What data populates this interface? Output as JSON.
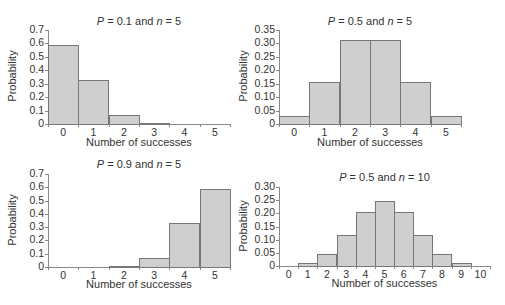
{
  "chart_data": [
    {
      "type": "bar",
      "title": "P = 0.1 and n = 5",
      "title_parts": {
        "p_label": "P",
        "p_value": " = 0.1 and ",
        "n_label": "n",
        "n_value": " = 5"
      },
      "xlabel": "Number of successes",
      "ylabel": "Probability",
      "categories": [
        "0",
        "1",
        "2",
        "3",
        "4",
        "5"
      ],
      "values": [
        0.59,
        0.33,
        0.07,
        0.01,
        0.0,
        0.0
      ],
      "yticks": [
        "0.7",
        "0.6",
        "0.5",
        "0.4",
        "0.3",
        "0.2",
        "0.1",
        "0"
      ],
      "ylim": [
        0,
        0.7
      ],
      "grid": false
    },
    {
      "type": "bar",
      "title": "P = 0.5 and n = 5",
      "title_parts": {
        "p_label": "P",
        "p_value": " = 0.5 and ",
        "n_label": "n",
        "n_value": " = 5"
      },
      "xlabel": "Number of successes",
      "ylabel": "Probability",
      "categories": [
        "0",
        "1",
        "2",
        "3",
        "4",
        "5"
      ],
      "values": [
        0.031,
        0.156,
        0.312,
        0.312,
        0.156,
        0.031
      ],
      "yticks": [
        "0.35",
        "0.30",
        "0.25",
        "0.20",
        "0.15",
        "0.10",
        "0.05",
        "0"
      ],
      "ylim": [
        0,
        0.35
      ],
      "grid": false
    },
    {
      "type": "bar",
      "title": "P = 0.9 and n = 5",
      "title_parts": {
        "p_label": "P",
        "p_value": " = 0.9 and ",
        "n_label": "n",
        "n_value": " = 5"
      },
      "xlabel": "Number of successes",
      "ylabel": "Probability",
      "categories": [
        "0",
        "1",
        "2",
        "3",
        "4",
        "5"
      ],
      "values": [
        0.0,
        0.0,
        0.01,
        0.07,
        0.33,
        0.59
      ],
      "yticks": [
        "0.7",
        "0.6",
        "0.5",
        "0.4",
        "0.3",
        "0.2",
        "0.1",
        "0"
      ],
      "ylim": [
        0,
        0.7
      ],
      "grid": false
    },
    {
      "type": "bar",
      "title": "P = 0.5 and n = 10",
      "title_parts": {
        "p_label": "P",
        "p_value": " = 0.5 and ",
        "n_label": "n",
        "n_value": " =  10"
      },
      "xlabel": "Number of successes",
      "ylabel": "Probability",
      "categories": [
        "0",
        "1",
        "2",
        "3",
        "4",
        "5",
        "6",
        "7",
        "8",
        "9",
        "10"
      ],
      "values": [
        0.001,
        0.01,
        0.044,
        0.117,
        0.205,
        0.246,
        0.205,
        0.117,
        0.044,
        0.01,
        0.001
      ],
      "yticks": [
        "0.30",
        "0.25",
        "0.20",
        "0.15",
        "0.10",
        "0.05",
        "0"
      ],
      "ylim": [
        0,
        0.3
      ],
      "grid": false
    }
  ]
}
